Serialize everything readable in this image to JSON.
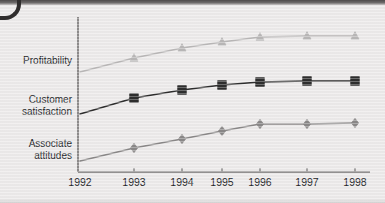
{
  "chart_data": {
    "type": "line",
    "title": "",
    "subtitle": "",
    "xlabel": "",
    "ylabel": "",
    "grid": false,
    "legend_position": "y-axis-labels-left",
    "categories": [
      "1992",
      "1993",
      "1994",
      "1995",
      "1996",
      "1997",
      "1998"
    ],
    "axis": {
      "x_range": [
        "1992",
        "1998"
      ],
      "y_tick_labels": [],
      "y_axis_shows_values": false
    },
    "series": [
      {
        "name": "Profitability",
        "marker": "triangle",
        "color": "#b9b7b7",
        "line_color": "#b9b7b7",
        "values": [
          0.42,
          0.53,
          0.61,
          0.66,
          0.7,
          0.71,
          0.71
        ],
        "markers_at": [
          "1993",
          "1994",
          "1995",
          "1996",
          "1997",
          "1998"
        ]
      },
      {
        "name": "Customer satisfaction",
        "marker": "square",
        "color": "#2e2e2e",
        "line_color": "#2e2e2e",
        "values": [
          0.15,
          0.28,
          0.35,
          0.39,
          0.41,
          0.42,
          0.42
        ],
        "markers_at": [
          "1993",
          "1994",
          "1995",
          "1996",
          "1997",
          "1998"
        ]
      },
      {
        "name": "Associate attitudes",
        "marker": "diamond",
        "color": "#8a8888",
        "line_color": "#8a8888",
        "values": [
          -0.23,
          -0.12,
          -0.05,
          0.01,
          0.07,
          0.07,
          0.08
        ],
        "markers_at": [
          "1993",
          "1994",
          "1995",
          "1996",
          "1997",
          "1998"
        ]
      }
    ],
    "pixel_geometry": {
      "x_positions": [
        80,
        134,
        182,
        222,
        260,
        307,
        355
      ],
      "series_y": {
        "Profitability": [
          72,
          58,
          48,
          42,
          37,
          36,
          36
        ],
        "Customer satisfaction": [
          114,
          98,
          90,
          85,
          82,
          81,
          81
        ],
        "Associate attitudes": [
          161,
          148,
          139,
          131,
          124,
          124,
          123
        ]
      },
      "axis_x": 78,
      "axis_y": 172,
      "axis_top": 17,
      "axis_right": 370
    }
  },
  "labels": {
    "profitability": "Profitability",
    "customer_satisfaction": "Customer\nsatisfaction",
    "associate_attitudes": "Associate\nattitudes"
  },
  "colors": {
    "background": "#eceaea",
    "axis": "#767373",
    "text": "#26282b",
    "profitability": "#b9b7b7",
    "customer_satisfaction": "#2e2e2e",
    "associate_attitudes": "#8a8888"
  }
}
